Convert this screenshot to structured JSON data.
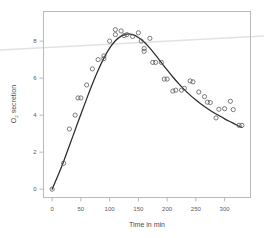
{
  "chart_data": {
    "type": "scatter",
    "title": "",
    "xlabel": "Time in min",
    "ylabel": "O2 secretion",
    "ylabel_base": "O",
    "ylabel_sub": "2",
    "ylabel_rest": " secretion",
    "xlim": [
      -15,
      345
    ],
    "ylim": [
      -0.45,
      9.6
    ],
    "xticks": [
      0,
      50,
      100,
      150,
      200,
      250,
      300
    ],
    "yticks": [
      0,
      2,
      4,
      6,
      8
    ],
    "xtick_labels": [
      "0",
      "50",
      "100",
      "150",
      "200",
      "250",
      "300"
    ],
    "ytick_labels": [
      "0",
      "2",
      "4",
      "6",
      "8"
    ],
    "grid": false,
    "legend": null,
    "point_marker": "open-circle",
    "series": [
      {
        "name": "O2 secretion measurements",
        "type": "scatter",
        "x": [
          0,
          20,
          30,
          40,
          45,
          50,
          60,
          70,
          80,
          90,
          90,
          100,
          110,
          110,
          120,
          125,
          130,
          140,
          150,
          155,
          160,
          160,
          170,
          175,
          180,
          190,
          195,
          200,
          210,
          215,
          225,
          230,
          240,
          245,
          255,
          265,
          270,
          275,
          285,
          290,
          300,
          310,
          315,
          325,
          330
        ],
        "y": [
          0.0,
          1.4,
          3.25,
          4.0,
          4.93,
          4.93,
          5.63,
          6.5,
          7.0,
          7.2,
          7.05,
          8.0,
          8.62,
          8.35,
          8.55,
          8.3,
          8.35,
          8.25,
          8.45,
          8.0,
          7.6,
          7.45,
          8.15,
          6.85,
          6.85,
          6.85,
          5.95,
          5.95,
          5.3,
          5.35,
          5.35,
          5.45,
          5.85,
          5.8,
          5.25,
          5.0,
          4.7,
          4.68,
          3.85,
          4.32,
          4.35,
          4.75,
          4.3,
          3.45,
          3.45
        ]
      },
      {
        "name": "Fitted curve",
        "type": "line",
        "x": [
          0,
          10,
          20,
          30,
          40,
          50,
          60,
          70,
          80,
          90,
          100,
          110,
          120,
          130,
          140,
          150,
          160,
          170,
          180,
          190,
          200,
          210,
          220,
          230,
          240,
          250,
          260,
          270,
          280,
          290,
          300,
          310,
          320,
          330
        ],
        "y": [
          0.0,
          0.72,
          1.5,
          2.35,
          3.2,
          4.05,
          4.88,
          5.68,
          6.42,
          7.08,
          7.62,
          8.02,
          8.27,
          8.38,
          8.35,
          8.2,
          7.95,
          7.62,
          7.24,
          6.84,
          6.44,
          6.06,
          5.7,
          5.38,
          5.08,
          4.82,
          4.58,
          4.36,
          4.16,
          3.98,
          3.8,
          3.64,
          3.48,
          3.33
        ]
      }
    ],
    "artifact_line": {
      "name": "scan-artifact-streak",
      "x1": 0,
      "y1": 50,
      "x2": 264,
      "y2": 36,
      "color": "#e2e2e2"
    },
    "colors": {
      "point": "#5c5c5c",
      "curve": "#2b2b2b",
      "frame": "#b9b9b9",
      "text": "#555555",
      "background": "#ffffff"
    }
  }
}
